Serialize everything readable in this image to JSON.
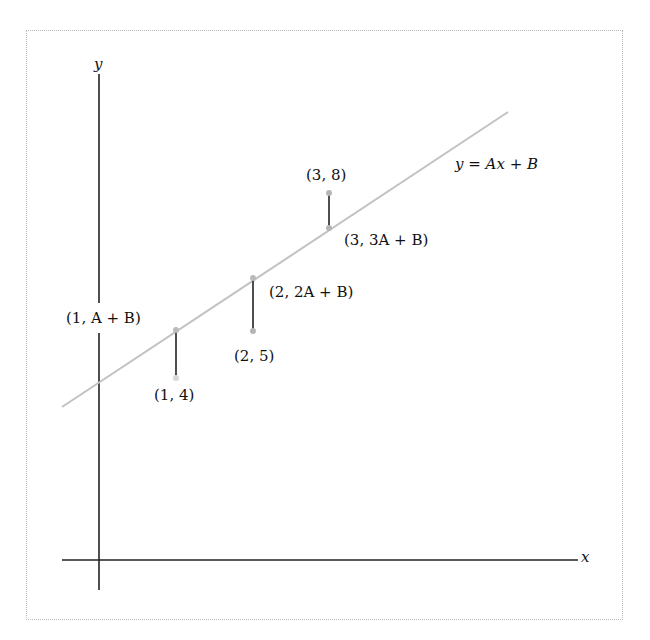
{
  "diagram": {
    "axes": {
      "x_label": "x",
      "y_label": "y"
    },
    "line_label": "y = Ax + B",
    "data_points": [
      {
        "label": "(1, 4)",
        "x": 1,
        "y": 4
      },
      {
        "label": "(2, 5)",
        "x": 2,
        "y": 5
      },
      {
        "label": "(3, 8)",
        "x": 3,
        "y": 8
      }
    ],
    "line_points": [
      {
        "label": "(1, A + B)"
      },
      {
        "label": "(2, 2A + B)"
      },
      {
        "label": "(3, 3A + B)"
      }
    ],
    "colors": {
      "axis": "#222222",
      "fit_line": "#bdbdbd",
      "residual": "#222222",
      "point": "#b0b0b0",
      "frame": "#b8b8b8"
    }
  }
}
